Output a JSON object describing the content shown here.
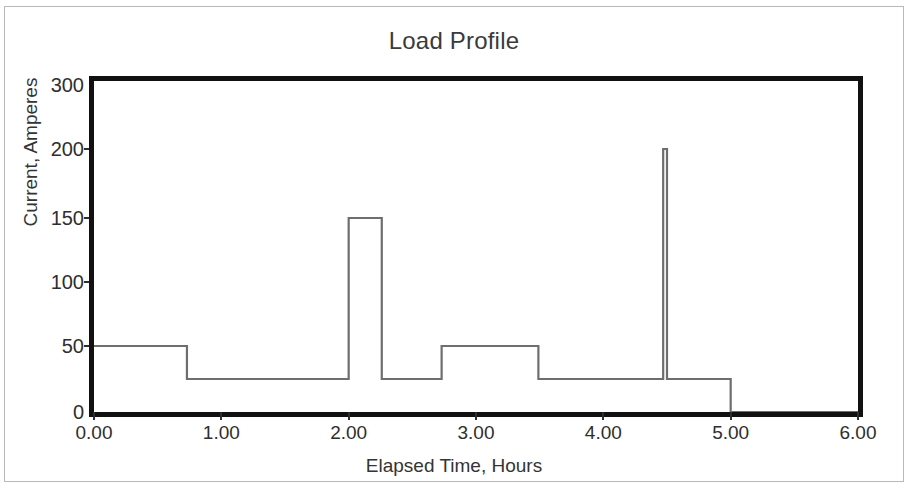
{
  "chart_data": {
    "type": "line",
    "title": "Load Profile",
    "xlabel": "Elapsed Time, Hours",
    "ylabel": "Current, Amperes",
    "xlim": [
      0,
      6
    ],
    "ylim": [
      0,
      300
    ],
    "grid": false,
    "legend": null,
    "xticks": [
      {
        "value": 0,
        "label": "0.00"
      },
      {
        "value": 1,
        "label": "1.00"
      },
      {
        "value": 2,
        "label": "2.00"
      },
      {
        "value": 3,
        "label": "3.00"
      },
      {
        "value": 4,
        "label": "4.00"
      },
      {
        "value": 5,
        "label": "5.00"
      },
      {
        "value": 6,
        "label": "6.00"
      }
    ],
    "yticks": [
      {
        "value": 0,
        "label": "0"
      },
      {
        "value": 50,
        "label": "50"
      },
      {
        "value": 100,
        "label": "100"
      },
      {
        "value": 150,
        "label": "150"
      },
      {
        "value": 200,
        "label": "200"
      },
      {
        "value": 300,
        "label": "300"
      }
    ],
    "series": [
      {
        "name": "Load current",
        "style": "step",
        "color": "#6e6e6e",
        "steps": [
          {
            "t_start": 0.0,
            "t_end": 0.73,
            "current": 50
          },
          {
            "t_start": 0.73,
            "t_end": 2.0,
            "current": 25
          },
          {
            "t_start": 2.0,
            "t_end": 2.26,
            "current": 150
          },
          {
            "t_start": 2.26,
            "t_end": 2.73,
            "current": 25
          },
          {
            "t_start": 2.73,
            "t_end": 3.49,
            "current": 50
          },
          {
            "t_start": 3.49,
            "t_end": 4.47,
            "current": 25
          },
          {
            "t_start": 4.47,
            "t_end": 4.5,
            "current": 200
          },
          {
            "t_start": 4.5,
            "t_end": 5.0,
            "current": 25
          },
          {
            "t_start": 5.0,
            "t_end": 6.0,
            "current": 0
          }
        ],
        "x": [
          0.0,
          0.73,
          0.73,
          2.0,
          2.0,
          2.26,
          2.26,
          2.73,
          2.73,
          3.49,
          3.49,
          4.47,
          4.47,
          4.5,
          4.5,
          5.0,
          5.0,
          6.0
        ],
        "y": [
          50,
          50,
          25,
          25,
          150,
          150,
          25,
          25,
          50,
          50,
          25,
          25,
          200,
          200,
          25,
          25,
          0,
          0
        ]
      }
    ]
  },
  "colors": {
    "trace": "#6e6e6e",
    "axis": "#111111",
    "text": "#2e2e2e",
    "frame": "#b9b9b9",
    "background": "#ffffff"
  }
}
